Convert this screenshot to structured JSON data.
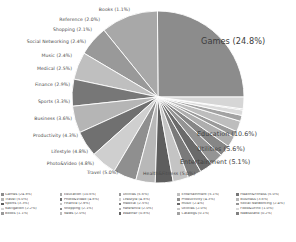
{
  "chart_data": {
    "type": "pie",
    "title": "",
    "unit": "percent",
    "legend_position": "bottom",
    "start_angle_deg": 0,
    "direction": "counterclockwise",
    "categories": [
      "Games",
      "Education",
      "Utilities",
      "Entertainment",
      "Health&Fitness",
      "Travel",
      "Photo&Video",
      "Lifestyle",
      "Productivity",
      "Business",
      "Sports",
      "Finance",
      "Medical",
      "Music",
      "Social Networking",
      "Shopping",
      "Reference",
      "Books",
      "News",
      "Catalogs",
      "Food&Drink",
      "Newsstand",
      "Navigation"
    ],
    "values": [
      24.8,
      10.6,
      5.6,
      5.1,
      5.0,
      5.0,
      4.8,
      4.8,
      4.3,
      3.6,
      3.3,
      2.9,
      2.5,
      2.4,
      2.4,
      2.1,
      2.0,
      1.1,
      2.0,
      1.1,
      1.0,
      0.2,
      2.2
    ],
    "labels": [
      {
        "name": "Games",
        "pct": "24.8%",
        "text": "Games (24.8%)"
      },
      {
        "name": "Education",
        "pct": "10.6%",
        "text": "Education (10.6%)"
      },
      {
        "name": "Utilities",
        "pct": "5.6%",
        "text": "Utilities (5.6%)"
      },
      {
        "name": "Entertainment",
        "pct": "5.1%",
        "text": "Entertainment (5.1%)"
      },
      {
        "name": "Health&Fitness",
        "pct": "5.0%",
        "text": "Health&Fitness (5.0%)"
      },
      {
        "name": "Travel",
        "pct": "5.0%",
        "text": "Travel (5.0%)"
      },
      {
        "name": "Photo&Video",
        "pct": "4.8%",
        "text": "Photo&Video (4.8%)"
      },
      {
        "name": "Lifestyle",
        "pct": "4.8%",
        "text": "Lifestyle (4.8%)"
      },
      {
        "name": "Productivity",
        "pct": "4.3%",
        "text": "Productivity (4.3%)"
      },
      {
        "name": "Business",
        "pct": "3.6%",
        "text": "Business (3.6%)"
      },
      {
        "name": "Sports",
        "pct": "3.3%",
        "text": "Sports (3.3%)"
      },
      {
        "name": "Finance",
        "pct": "2.9%",
        "text": "Finance (2.9%)"
      },
      {
        "name": "Medical",
        "pct": "2.5%",
        "text": "Medical (2.5%)"
      },
      {
        "name": "Music",
        "pct": "2.4%",
        "text": "Music (2.4%)"
      },
      {
        "name": "Social Networking",
        "pct": "2.4%",
        "text": "Social Networking (2.4%)"
      },
      {
        "name": "Shopping",
        "pct": "2.1%",
        "text": "Shopping (2.1%)"
      },
      {
        "name": "Reference",
        "pct": "2.0%",
        "text": "Reference (2.0%)"
      },
      {
        "name": "Books",
        "pct": "1.1%",
        "text": "Books (1.1%)"
      }
    ]
  },
  "legend": {
    "columns": [
      [
        {
          "text": "Games (24.8%)",
          "color": "#8c8c8c"
        },
        {
          "text": "Travel (5.0%)",
          "color": "#b5b5b5"
        },
        {
          "text": "Sports (3.3%)",
          "color": "#5e5e5e"
        },
        {
          "text": "Navigation (2.2%)",
          "color": "#d6d6d6"
        },
        {
          "text": "Books (1.1%)",
          "color": "#9a9a9a"
        }
      ],
      [
        {
          "text": "Education (10.6%)",
          "color": "#a8a8a8"
        },
        {
          "text": "Photo&Video (4.8%)",
          "color": "#707070"
        },
        {
          "text": "Finance (2.9%)",
          "color": "#c4c4c4"
        },
        {
          "text": "Shopping (2.1%)",
          "color": "#868686"
        },
        {
          "text": "News (2.0%)",
          "color": "#bdbdbd"
        }
      ],
      [
        {
          "text": "Utilities (5.6%)",
          "color": "#999999"
        },
        {
          "text": "Lifestyle (4.8%)",
          "color": "#cfcfcf"
        },
        {
          "text": "Medical (2.5%)",
          "color": "#7a7a7a"
        },
        {
          "text": "Reference (2.0%)",
          "color": "#aeaeae"
        },
        {
          "text": "Weather (0.8%)",
          "color": "#646464"
        }
      ],
      [
        {
          "text": "Entertainment (5.1%)",
          "color": "#bfbfbf"
        },
        {
          "text": "Productivity (4.3%)",
          "color": "#8f8f8f"
        },
        {
          "text": "Music (2.4%)",
          "color": "#6a6a6a"
        },
        {
          "text": "Utilities (2.0%)",
          "color": "#c9c9c9"
        },
        {
          "text": "Catalogs (0.1%)",
          "color": "#a2a2a2"
        }
      ],
      [
        {
          "text": "Health&Fitness (5.0%)",
          "color": "#777777"
        },
        {
          "text": "Business (3.6%)",
          "color": "#b8b8b8"
        },
        {
          "text": "Social Networking (2.4%)",
          "color": "#949494"
        },
        {
          "text": "Food&Drink (1.0%)",
          "color": "#dadada"
        },
        {
          "text": "Newsstand (0.2%)",
          "color": "#818181"
        }
      ]
    ]
  }
}
